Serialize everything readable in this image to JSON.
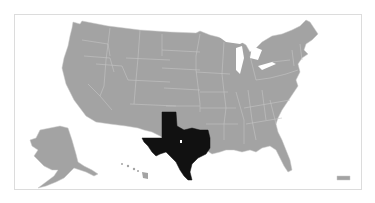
{
  "map": {
    "type": "choropleth",
    "region": "United States",
    "highlighted_state": "Texas",
    "highlight_color": "#111111",
    "base_color": "#a3a3a3",
    "border_color": "#c8c8c8",
    "background_color": "#ffffff",
    "frame_border_color": "#dcdcdc",
    "insets": [
      "Alaska",
      "Hawaii",
      "Puerto Rico"
    ]
  },
  "attribution": ""
}
